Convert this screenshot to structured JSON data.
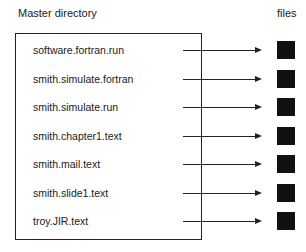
{
  "diagram": {
    "directory_title": "Master directory",
    "files_title": "files",
    "entries": [
      {
        "name": "software.fortran.run"
      },
      {
        "name": "smith.simulate.fortran"
      },
      {
        "name": "smith.simulate.run"
      },
      {
        "name": "smith.chapter1.text"
      },
      {
        "name": "smith.mail.text"
      },
      {
        "name": "smith.slide1.text"
      },
      {
        "name": "troy.JIR.text"
      }
    ]
  }
}
